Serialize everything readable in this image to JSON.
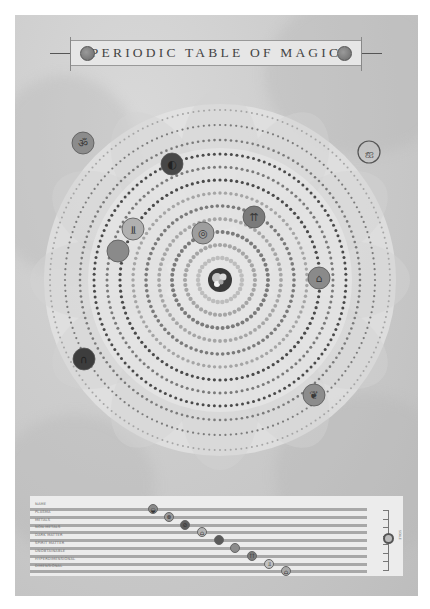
{
  "header": {
    "title": "PERIODIC TABLE OF MAGIC"
  },
  "colors": {
    "paper": "#cfcfcf",
    "dot_dark": "#4a4a4a",
    "dot_mid": "#7a7a7a",
    "dot_light": "#a5a5a5",
    "dot_pale": "#bdbdbd"
  },
  "mandala": {
    "center": [
      205,
      265
    ],
    "core_icon": "yin-blob-icon",
    "rings": [
      {
        "radius": 22,
        "dot": 4.5,
        "count": 30,
        "tone": "dot_pale"
      },
      {
        "radius": 35,
        "dot": 4.2,
        "count": 44,
        "tone": "dot_light"
      },
      {
        "radius": 48,
        "dot": 4.0,
        "count": 58,
        "tone": "dot_mid"
      },
      {
        "radius": 61,
        "dot": 3.8,
        "count": 72,
        "tone": "dot_light"
      },
      {
        "radius": 74,
        "dot": 3.6,
        "count": 86,
        "tone": "dot_mid"
      },
      {
        "radius": 87,
        "dot": 3.4,
        "count": 100,
        "tone": "dot_light"
      },
      {
        "radius": 100,
        "dot": 3.2,
        "count": 112,
        "tone": "dot_dark"
      },
      {
        "radius": 113,
        "dot": 3.0,
        "count": 128,
        "tone": "dot_mid"
      },
      {
        "radius": 126,
        "dot": 3.0,
        "count": 140,
        "tone": "dot_dark"
      },
      {
        "radius": 140,
        "dot": 2.6,
        "count": 160,
        "tone": "dot_mid"
      },
      {
        "radius": 155,
        "dot": 2.2,
        "count": 180,
        "tone": "dot_mid"
      },
      {
        "radius": 170,
        "dot": 2.0,
        "count": 200,
        "tone": "dot_light"
      }
    ],
    "element_icons": [
      {
        "name": "om-symbol-icon",
        "glyph": "ॐ",
        "x": 83,
        "y": 143,
        "r": 11,
        "fill": "#8c8c8c"
      },
      {
        "name": "dark-moon-icon",
        "glyph": "◐",
        "x": 172,
        "y": 164,
        "r": 11,
        "fill": "#474747"
      },
      {
        "name": "trident-up-icon",
        "glyph": "⇈",
        "x": 254,
        "y": 217,
        "r": 11,
        "fill": "#7a7a7a"
      },
      {
        "name": "trident-down-icon",
        "glyph": "⫫",
        "x": 133,
        "y": 229,
        "r": 11,
        "fill": "#b0b0b0"
      },
      {
        "name": "swirl-icon",
        "glyph": "◎",
        "x": 203,
        "y": 233,
        "r": 11,
        "fill": "#9e9e9e"
      },
      {
        "name": "gray-orb-icon",
        "glyph": "",
        "x": 118,
        "y": 251,
        "r": 11,
        "fill": "#8a8a8a"
      },
      {
        "name": "gateway-icon",
        "glyph": "⌂",
        "x": 319,
        "y": 278,
        "r": 11,
        "fill": "#8a8a8a"
      },
      {
        "name": "arch-door-icon",
        "glyph": "∩",
        "x": 84,
        "y": 359,
        "r": 11,
        "fill": "#3d3d3d"
      },
      {
        "name": "rune-icon",
        "glyph": "❦",
        "x": 314,
        "y": 395,
        "r": 11,
        "fill": "#8c8c8c"
      },
      {
        "name": "outlined-rune-icon",
        "glyph": "ஐ",
        "x": 369,
        "y": 152,
        "r": 11,
        "fill": "none"
      }
    ]
  },
  "legend": {
    "rows": [
      {
        "label": "NAME",
        "icon": "plasma-icon",
        "glyph": "◒",
        "icon_x": 123,
        "fill": "#8a8a8a"
      },
      {
        "label": "PLASMA",
        "icon": "plasma-swirl-icon",
        "glyph": "⊗",
        "icon_x": 139,
        "fill": "#9a9a9a"
      },
      {
        "label": "METALS",
        "icon": "metal-icon",
        "glyph": "⊘",
        "icon_x": 155,
        "fill": "#5e5e5e"
      },
      {
        "label": "NON-METALS",
        "icon": "non-metal-icon",
        "glyph": "⌂",
        "icon_x": 172,
        "fill": "#b4b4b4"
      },
      {
        "label": "DARK MATTER",
        "icon": "dark-matter-icon",
        "glyph": "",
        "icon_x": 189,
        "fill": "#5a5a5a"
      },
      {
        "label": "SPIRIT MATTER",
        "icon": "spirit-matter-icon",
        "glyph": "",
        "icon_x": 205,
        "fill": "#8c8c8c"
      },
      {
        "label": "UNOBTAINABLE",
        "icon": "unobtainable-icon",
        "glyph": "⇈",
        "icon_x": 222,
        "fill": "#7c7c7c"
      },
      {
        "label": "HYPERDIMENSIONAL",
        "icon": "hyperdimensional-icon",
        "glyph": "⫫",
        "icon_x": 239,
        "fill": "#c2c2c2"
      },
      {
        "label": "DIMENSIONAL",
        "icon": "dimensional-icon",
        "glyph": "⌂",
        "icon_x": 256,
        "fill": "#a8a8a8"
      }
    ],
    "scale_label": "SCALE"
  }
}
